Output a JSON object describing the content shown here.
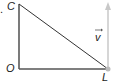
{
  "diagram": {
    "points": {
      "C": {
        "label": "C",
        "x": 19,
        "y": 4
      },
      "O": {
        "label": "O",
        "x": 19,
        "y": 69
      },
      "L": {
        "label": "L",
        "x": 108,
        "y": 69
      }
    },
    "vector": {
      "label": "v",
      "from": "L",
      "direction": "up",
      "color": "#c8c8c8"
    },
    "stray_mark": ".",
    "colors": {
      "line": "#333333",
      "vector": "#c8c8c8",
      "point_L": "#bbbbbb"
    }
  }
}
